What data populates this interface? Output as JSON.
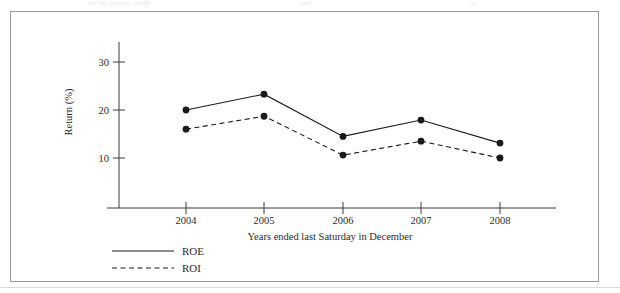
{
  "page": {
    "border_color": "#9a9a9a",
    "background": "#ffffff",
    "top_bleed_text": {
      "fragment_left": "the 50 percent, while",
      "fragment_mid": "and",
      "fragment_right": "of"
    }
  },
  "chart_data": {
    "type": "line",
    "title": "",
    "xlabel": "Years ended last Saturday in December",
    "ylabel": "Return (%)",
    "categories": [
      "2004",
      "2005",
      "2006",
      "2007",
      "2008"
    ],
    "x": [
      2004,
      2005,
      2006,
      2007,
      2008
    ],
    "xtick_labels": [
      "2004",
      "2005",
      "2006",
      "2007",
      "2008"
    ],
    "ytick_labels": [
      "10",
      "20",
      "30"
    ],
    "yticks": [
      10,
      20,
      30
    ],
    "ylim": [
      0,
      34
    ],
    "grid": false,
    "legend_position": "below-left",
    "series": [
      {
        "name": "ROE",
        "label": "ROE",
        "style": "solid",
        "color": "#1a1a1a",
        "marker": "circle",
        "values": [
          20.0,
          23.3,
          14.5,
          17.9,
          13.1
        ]
      },
      {
        "name": "ROI",
        "label": "ROI",
        "style": "dashed",
        "color": "#1a1a1a",
        "marker": "circle",
        "values": [
          16.0,
          18.7,
          10.6,
          13.5,
          10.0
        ]
      }
    ]
  },
  "legend": {
    "entries": [
      {
        "label": "ROE",
        "style": "solid"
      },
      {
        "label": "ROI",
        "style": "dashed"
      }
    ]
  }
}
